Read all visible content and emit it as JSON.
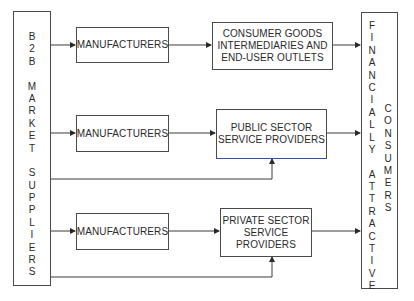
{
  "diagram": {
    "source": {
      "label_lines": [
        "B",
        "2",
        "B",
        "",
        "M",
        "A",
        "R",
        "K",
        "E",
        "T",
        "",
        "S",
        "U",
        "P",
        "P",
        "L",
        "I",
        "E",
        "R",
        "S"
      ],
      "text": "B2B MARKET SUPPLIERS"
    },
    "rows": [
      {
        "manufacturer": "MANUFACTURERS",
        "target": "CONSUMER GOODS\nINTERMEDIARIES AND\nEND-USER OUTLETS",
        "direct_supply_link": false
      },
      {
        "manufacturer": "MANUFACTURERS",
        "target": "PUBLIC SECTOR\nSERVICE PROVIDERS",
        "direct_supply_link": true
      },
      {
        "manufacturer": "MANUFACTURERS",
        "target": "PRIVATE SECTOR\nSERVICE PROVIDERS",
        "direct_supply_link": true
      }
    ],
    "destination": {
      "col1_lines": [
        "F",
        "I",
        "N",
        "A",
        "N",
        "C",
        "I",
        "A",
        "L",
        "L",
        "Y",
        "",
        "A",
        "T",
        "T",
        "R",
        "A",
        "C",
        "T",
        "I",
        "V",
        "E"
      ],
      "col2_lines": [
        "C",
        "O",
        "N",
        "S",
        "U",
        "M",
        "E",
        "R",
        "S"
      ],
      "text": "FINANCIALLY ATTRACTIVE CONSUMERS"
    },
    "colors": {
      "line": "#3a3a3a",
      "border": "#4a4a4a",
      "highlight_edge": "#3b4fb0"
    }
  }
}
